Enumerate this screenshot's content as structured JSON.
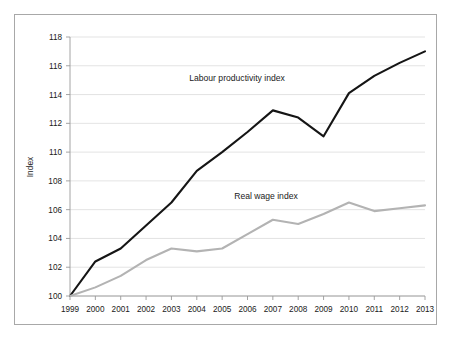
{
  "figure": {
    "background_color": "#ffffff",
    "frame_border_color": "#a8a8a8"
  },
  "chart_data": {
    "type": "line",
    "title": "",
    "subtitle": "",
    "xlabel": "",
    "ylabel": "Index",
    "x": [
      1999,
      2000,
      2001,
      2002,
      2003,
      2004,
      2005,
      2006,
      2007,
      2008,
      2009,
      2010,
      2011,
      2012,
      2013
    ],
    "categories": [
      "1999",
      "2000",
      "2001",
      "2002",
      "2003",
      "2004",
      "2005",
      "2006",
      "2007",
      "2008",
      "2009",
      "2010",
      "2011",
      "2012",
      "2013"
    ],
    "xlim": [
      1999,
      2013
    ],
    "ylim": [
      100,
      118
    ],
    "ytick_step": 2,
    "yticks": [
      100,
      102,
      104,
      106,
      108,
      110,
      112,
      114,
      116,
      118
    ],
    "ytick_labels": [
      "100",
      "102",
      "104",
      "106",
      "108",
      "110",
      "112",
      "114",
      "116",
      "118"
    ],
    "grid": "horizontal",
    "grid_color": "#dcdcdc",
    "legend_position": "inline-annotation",
    "series": [
      {
        "name": "Labour productivity index",
        "color": "#151515",
        "line_width": 2.1,
        "annotation_label": "Labour productivity index",
        "values": [
          100.0,
          102.4,
          103.3,
          104.9,
          106.5,
          108.7,
          110.0,
          111.4,
          112.9,
          112.4,
          111.1,
          114.1,
          115.3,
          116.2,
          117.0
        ]
      },
      {
        "name": "Real wage index",
        "color": "#b3b3b3",
        "line_width": 2.1,
        "annotation_label": "Real wage index",
        "values": [
          100.0,
          100.6,
          101.4,
          102.5,
          103.3,
          103.1,
          103.3,
          104.3,
          105.3,
          105.0,
          105.7,
          106.5,
          105.9,
          106.1,
          106.3
        ]
      }
    ]
  }
}
